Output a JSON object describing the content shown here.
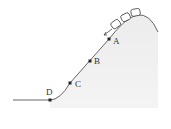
{
  "diagram": {
    "points": [
      {
        "label": "A",
        "x": 109,
        "y": 39
      },
      {
        "label": "B",
        "x": 90,
        "y": 61
      },
      {
        "label": "C",
        "x": 70,
        "y": 83
      },
      {
        "label": "D",
        "x": 50,
        "y": 100
      }
    ],
    "cars_count": 3,
    "motion_arrow": "down-slope",
    "colors": {
      "hill_fill": "#e6e6e6",
      "track": "#555555",
      "point": "#222222"
    }
  }
}
